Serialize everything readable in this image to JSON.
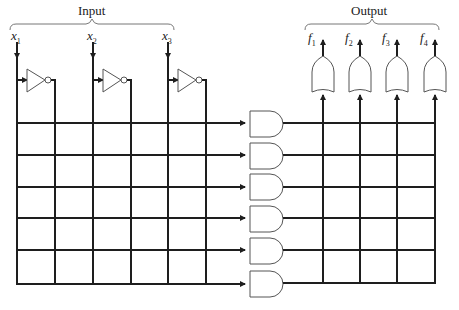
{
  "diagram": {
    "type": "PLA (programmable logic array) schematic",
    "input_group_label": "Input",
    "output_group_label": "Output",
    "inputs": [
      {
        "name": "x",
        "sub": "1"
      },
      {
        "name": "x",
        "sub": "2"
      },
      {
        "name": "x",
        "sub": "3"
      }
    ],
    "outputs": [
      {
        "name": "f",
        "sub": "1"
      },
      {
        "name": "f",
        "sub": "2"
      },
      {
        "name": "f",
        "sub": "3"
      },
      {
        "name": "f",
        "sub": "4"
      }
    ],
    "inverter_count": 3,
    "and_gate_count": 6,
    "or_gate_count": 4,
    "colors": {
      "line": "#1e1e1e",
      "gate_outline": "#555555",
      "background": "#ffffff",
      "brace": "#777777"
    }
  }
}
